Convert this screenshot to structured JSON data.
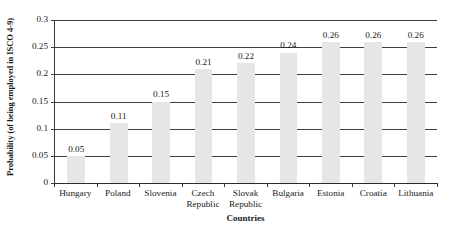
{
  "chart_data": {
    "type": "bar",
    "title": "",
    "xlabel": "Countries",
    "ylabel": "Probability (of being employed in ISCO 4-9)",
    "categories": [
      "Hungary",
      "Poland",
      "Slovenia",
      "Czech Republic",
      "Slovak Republic",
      "Bulgaria",
      "Estonia",
      "Croatia",
      "Lithuania"
    ],
    "category_lines": [
      [
        "Hungary"
      ],
      [
        "Poland"
      ],
      [
        "Slovenia"
      ],
      [
        "Czech",
        "Republic"
      ],
      [
        "Slovak",
        "Republic"
      ],
      [
        "Bulgaria"
      ],
      [
        "Estonia"
      ],
      [
        "Croatia"
      ],
      [
        "Lithuania"
      ]
    ],
    "values": [
      0.05,
      0.11,
      0.15,
      0.21,
      0.22,
      0.24,
      0.26,
      0.26,
      0.26
    ],
    "value_labels": [
      "0.05",
      "0.11",
      "0.15",
      "0.21",
      "0.22",
      "0.24",
      "0.26",
      "0.26",
      "0.26"
    ],
    "ylim": [
      0,
      0.3
    ],
    "ytick_values": [
      0,
      0.05,
      0.1,
      0.15,
      0.2,
      0.25,
      0.3
    ],
    "ytick_labels": [
      "0",
      "0.05",
      "0.1",
      "0.15",
      "0.2",
      "0.25",
      "0.3"
    ],
    "grid": true,
    "legend": null,
    "bar_color": "#e6e6e6",
    "axis_color": "#3f3f3f",
    "text_color": "#1a1a1a"
  }
}
